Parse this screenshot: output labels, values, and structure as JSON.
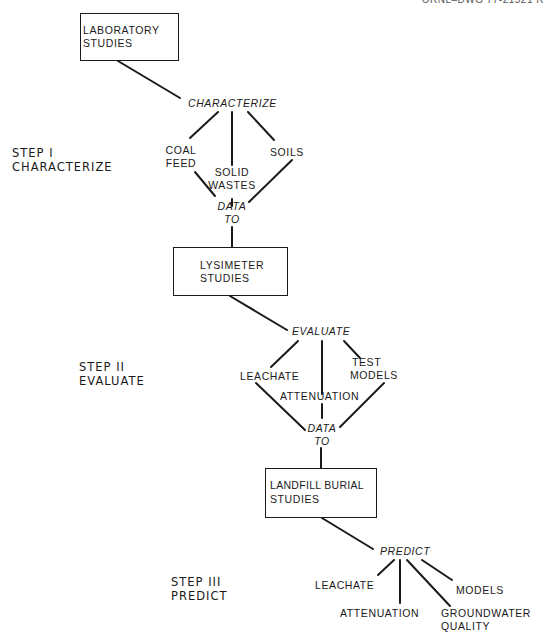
{
  "drawing_id": "ORNL–DWG 77-21521 R",
  "steps": [
    {
      "line1": "STEP I",
      "line2": "CHARACTERIZE"
    },
    {
      "line1": "STEP II",
      "line2": "EVALUATE"
    },
    {
      "line1": "STEP III",
      "line2": "PREDICT"
    }
  ],
  "boxes": {
    "laboratory": {
      "line1": "LABORATORY",
      "line2": "STUDIES"
    },
    "lysimeter": {
      "line1": "LYSIMETER",
      "line2": "STUDIES"
    },
    "landfill": {
      "line1": "LANDFILL BURIAL",
      "line2": "STUDIES"
    }
  },
  "actions": {
    "characterize": "CHARACTERIZE",
    "evaluate": "EVALUATE",
    "predict": "PREDICT"
  },
  "stage1_items": {
    "coal_feed": {
      "line1": "COAL",
      "line2": "FEED"
    },
    "solid_wastes": {
      "line1": "SOLID",
      "line2": "WASTES"
    },
    "soils": "SOILS"
  },
  "stage2_items": {
    "leachate": "LEACHATE",
    "attenuation": "ATTENUATION",
    "test_models": {
      "line1": "TEST",
      "line2": "MODELS"
    }
  },
  "stage3_items": {
    "leachate": "LEACHATE",
    "attenuation": "ATTENUATION",
    "groundwater_quality": {
      "line1": "GROUNDWATER",
      "line2": "QUALITY"
    },
    "models": "MODELS"
  },
  "connectors": {
    "data_to_1": {
      "line1": "DATA",
      "line2": "TO"
    },
    "data_to_2": {
      "line1": "DATA",
      "line2": "TO"
    }
  }
}
